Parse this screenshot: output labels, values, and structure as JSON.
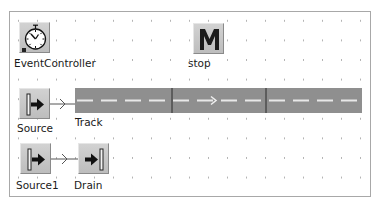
{
  "canvas": {
    "background": "#ffffff",
    "frame_border": "#a8a8a8",
    "grid_dot_color": "#b4b4b4"
  },
  "blocks": [
    {
      "id": "event-controller",
      "label": "EventController",
      "icon": "clock-icon"
    },
    {
      "id": "stop",
      "label": "stop",
      "icon": "m-letter-icon"
    },
    {
      "id": "source",
      "label": "Source",
      "icon": "source-arrow-icon"
    },
    {
      "id": "source1",
      "label": "Source1",
      "icon": "source-arrow-icon"
    },
    {
      "id": "drain",
      "label": "Drain",
      "icon": "drain-arrow-icon"
    }
  ],
  "track": {
    "label": "Track",
    "color": "#8f8f8f",
    "lane_marking_color": "#e8e8e8",
    "segment_dividers": 2
  },
  "connectors": [
    {
      "from": "Source",
      "to": "Track"
    },
    {
      "from": "Source1",
      "to": "Drain"
    }
  ]
}
